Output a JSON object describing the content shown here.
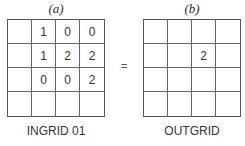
{
  "panel_a": {
    "label": "(a)",
    "caption": "INGRID 01",
    "cells": [
      [
        "",
        "1",
        "0",
        "0"
      ],
      [
        "",
        "1",
        "2",
        "2"
      ],
      [
        "",
        "0",
        "0",
        "2"
      ],
      [
        "",
        "",
        "",
        ""
      ]
    ]
  },
  "operator": "=",
  "panel_b": {
    "label": "(b)",
    "caption": "OUTGRID",
    "cells": [
      [
        "",
        "",
        "",
        ""
      ],
      [
        "",
        "",
        "2",
        ""
      ],
      [
        "",
        "",
        "",
        ""
      ],
      [
        "",
        "",
        "",
        ""
      ]
    ]
  }
}
